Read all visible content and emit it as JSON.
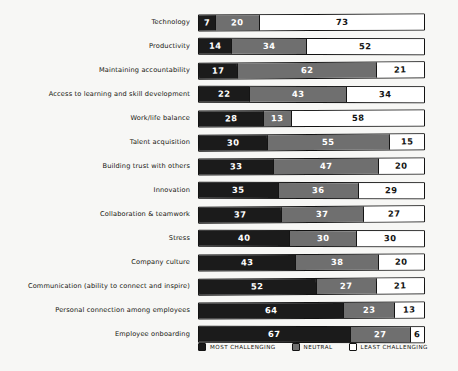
{
  "chart_data": {
    "type": "bar",
    "subtype": "stacked-horizontal-100-percent",
    "title": "",
    "subtitle": "",
    "xlabel": "",
    "ylabel": "",
    "xlim": [
      0,
      100
    ],
    "grid": false,
    "legend_position": "bottom",
    "categories": [
      "Technology",
      "Productivity",
      "Maintaining accountability",
      "Access to learning and skill development",
      "Work/life balance",
      "Talent acquisition",
      "Building trust with others",
      "Innovation",
      "Collaboration & teamwork",
      "Stress",
      "Company culture",
      "Communication (ability to connect and inspire)",
      "Personal connection among employees",
      "Employee onboarding"
    ],
    "series": [
      {
        "name": "MOST CHALLENGING",
        "color": "#1b1b1b",
        "values": [
          7,
          14,
          17,
          22,
          28,
          30,
          33,
          35,
          37,
          40,
          43,
          52,
          64,
          67
        ]
      },
      {
        "name": "NEUTRAL",
        "color": "#6f6f6f",
        "values": [
          20,
          34,
          62,
          43,
          13,
          55,
          47,
          36,
          37,
          30,
          38,
          27,
          23,
          27
        ]
      },
      {
        "name": "LEAST CHALLENGING",
        "color": "#ffffff",
        "values": [
          73,
          52,
          21,
          34,
          58,
          15,
          20,
          29,
          27,
          30,
          20,
          21,
          13,
          6
        ]
      }
    ]
  },
  "legend": {
    "items": [
      {
        "label": "MOST CHALLENGING",
        "swatch": "most"
      },
      {
        "label": "NEUTRAL",
        "swatch": "neutral"
      },
      {
        "label": "LEAST CHALLENGING",
        "swatch": "least"
      }
    ]
  },
  "colors": {
    "background": "#f7f7f5",
    "most": "#1b1b1b",
    "neutral": "#6f6f6f",
    "least": "#ffffff",
    "outline": "#111111",
    "text": "#15150f"
  }
}
